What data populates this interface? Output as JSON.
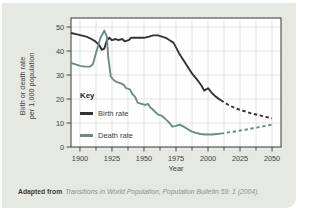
{
  "caption": {
    "prefix": "Adapted from",
    "text": "Transitions in World Population, Population Bulletin 59: 1 (2004)."
  },
  "colors": {
    "card_background": "#e6e9e2",
    "plot_background": "#ffffff",
    "grid": "#d9ddd5",
    "axis": "#4a4a4a",
    "tick_text": "#3f3f3f",
    "birth_rate_line": "#333333",
    "death_rate_line": "#6e8a87"
  },
  "chart_data": {
    "type": "line",
    "title": "",
    "xlabel": "Year",
    "ylabel_line1": "Birth or death rate",
    "ylabel_line2": "per 1,000 population",
    "xlim": [
      1893,
      2057
    ],
    "ylim": [
      0,
      50
    ],
    "x_ticks": [
      1900,
      1925,
      1950,
      1975,
      2000,
      2025,
      2050
    ],
    "x_minor_step": 12.5,
    "y_ticks": [
      0,
      10,
      20,
      30,
      40,
      50
    ],
    "grid": "on",
    "legend": {
      "title": "Key",
      "position": "inside-left",
      "entries": [
        {
          "label": "Birth rate",
          "color": "#333333"
        },
        {
          "label": "Death rate",
          "color": "#6e8a87"
        }
      ]
    },
    "series": [
      {
        "name": "Birth rate",
        "color": "#333333",
        "solid": [
          [
            1893,
            47.5
          ],
          [
            1897,
            47
          ],
          [
            1901,
            46.5
          ],
          [
            1905,
            46
          ],
          [
            1909,
            45
          ],
          [
            1912,
            44
          ],
          [
            1915,
            42.5
          ],
          [
            1917,
            40.5
          ],
          [
            1919,
            41
          ],
          [
            1921,
            44.5
          ],
          [
            1923,
            45.5
          ],
          [
            1925,
            44.5
          ],
          [
            1928,
            45
          ],
          [
            1930,
            44.5
          ],
          [
            1933,
            45
          ],
          [
            1935,
            44
          ],
          [
            1938,
            44.5
          ],
          [
            1940,
            45.5
          ],
          [
            1945,
            45.5
          ],
          [
            1950,
            45.5
          ],
          [
            1954,
            46
          ],
          [
            1957,
            46.5
          ],
          [
            1961,
            46.5
          ],
          [
            1964,
            46
          ],
          [
            1967,
            45.5
          ],
          [
            1970,
            44.5
          ],
          [
            1973,
            43.5
          ],
          [
            1975,
            41.5
          ],
          [
            1978,
            38.5
          ],
          [
            1981,
            36
          ],
          [
            1984,
            33.5
          ],
          [
            1987,
            31
          ],
          [
            1990,
            29
          ],
          [
            1993,
            27
          ],
          [
            1995,
            25.5
          ],
          [
            1997,
            23.5
          ],
          [
            2000,
            24.5
          ],
          [
            2003,
            22.5
          ],
          [
            2006,
            21
          ],
          [
            2010,
            19.5
          ]
        ],
        "dashed": [
          [
            2010,
            19.5
          ],
          [
            2016,
            17.5
          ],
          [
            2022,
            16
          ],
          [
            2028,
            15
          ],
          [
            2034,
            14
          ],
          [
            2040,
            13.2
          ],
          [
            2045,
            12.6
          ],
          [
            2050,
            12
          ]
        ]
      },
      {
        "name": "Death rate",
        "color": "#6e8a87",
        "solid": [
          [
            1893,
            35
          ],
          [
            1896,
            34.5
          ],
          [
            1900,
            33.8
          ],
          [
            1904,
            33.5
          ],
          [
            1908,
            33.5
          ],
          [
            1910,
            34.5
          ],
          [
            1913,
            40
          ],
          [
            1916,
            45.5
          ],
          [
            1919,
            48.5
          ],
          [
            1921,
            46
          ],
          [
            1922,
            38
          ],
          [
            1924,
            29.5
          ],
          [
            1926,
            28
          ],
          [
            1929,
            27
          ],
          [
            1932,
            26.5
          ],
          [
            1934,
            26
          ],
          [
            1936,
            24.5
          ],
          [
            1939,
            24
          ],
          [
            1941,
            22
          ],
          [
            1943,
            21
          ],
          [
            1945,
            18.5
          ],
          [
            1948,
            18
          ],
          [
            1951,
            17.5
          ],
          [
            1953,
            18
          ],
          [
            1955,
            16.5
          ],
          [
            1958,
            15
          ],
          [
            1961,
            13.5
          ],
          [
            1964,
            13
          ],
          [
            1967,
            11.5
          ],
          [
            1970,
            10
          ],
          [
            1972,
            8.5
          ],
          [
            1975,
            8.8
          ],
          [
            1978,
            9.3
          ],
          [
            1981,
            8.5
          ],
          [
            1984,
            7.5
          ],
          [
            1987,
            6.5
          ],
          [
            1990,
            6
          ],
          [
            1994,
            5.4
          ],
          [
            1998,
            5.2
          ],
          [
            2003,
            5.2
          ],
          [
            2007,
            5.4
          ],
          [
            2010,
            5.6
          ]
        ],
        "dashed": [
          [
            2010,
            5.6
          ],
          [
            2016,
            6.1
          ],
          [
            2022,
            6.6
          ],
          [
            2028,
            7.1
          ],
          [
            2034,
            7.7
          ],
          [
            2040,
            8.3
          ],
          [
            2045,
            8.8
          ],
          [
            2050,
            9.3
          ]
        ]
      }
    ]
  }
}
